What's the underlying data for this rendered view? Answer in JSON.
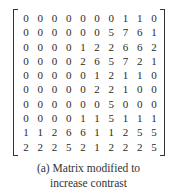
{
  "matrix": {
    "rows": [
      [
        0,
        0,
        0,
        0,
        0,
        0,
        0,
        1,
        1,
        0
      ],
      [
        0,
        0,
        0,
        0,
        0,
        0,
        5,
        7,
        6,
        1
      ],
      [
        0,
        0,
        0,
        0,
        1,
        2,
        2,
        6,
        6,
        2
      ],
      [
        0,
        0,
        0,
        0,
        2,
        6,
        5,
        7,
        2,
        1
      ],
      [
        0,
        0,
        0,
        0,
        0,
        1,
        2,
        1,
        1,
        0
      ],
      [
        0,
        0,
        0,
        0,
        0,
        2,
        2,
        1,
        0,
        0
      ],
      [
        0,
        0,
        0,
        0,
        0,
        0,
        5,
        0,
        0,
        0
      ],
      [
        0,
        0,
        0,
        0,
        1,
        1,
        5,
        1,
        1,
        1
      ],
      [
        1,
        1,
        2,
        6,
        6,
        1,
        1,
        2,
        5,
        5
      ],
      [
        2,
        2,
        2,
        5,
        2,
        1,
        2,
        2,
        2,
        5
      ]
    ]
  },
  "caption": {
    "line1": "(a)  Matrix modified to",
    "line2": "increase contrast"
  }
}
